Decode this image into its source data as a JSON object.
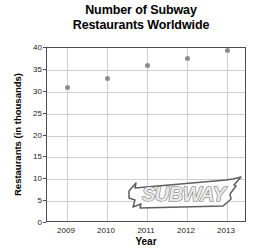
{
  "chart_data": {
    "type": "scatter",
    "title": "Number of Subway Restaurants Worldwide",
    "title_lines": [
      "Number of Subway",
      "Restaurants Worldwide"
    ],
    "xlabel": "Year",
    "ylabel": "Restaurants (in thousands)",
    "categories": [
      2009,
      2010,
      2011,
      2012,
      2013
    ],
    "x": [
      2009,
      2010,
      2011,
      2012,
      2013
    ],
    "values": [
      31,
      33,
      36,
      37.5,
      39.5
    ],
    "series": [
      {
        "name": "Subway restaurants worldwide",
        "values": [
          31,
          33,
          36,
          37.5,
          39.5
        ]
      }
    ],
    "points": [
      {
        "x": 2009,
        "y": 31
      },
      {
        "x": 2010,
        "y": 33
      },
      {
        "x": 2011,
        "y": 36
      },
      {
        "x": 2012,
        "y": 37.5
      },
      {
        "x": 2013,
        "y": 39.5
      }
    ],
    "xlim": [
      2008.5,
      2013.5
    ],
    "ylim": [
      0,
      40
    ],
    "yticks": [
      0,
      5,
      10,
      15,
      20,
      25,
      30,
      35,
      40
    ],
    "ytick_labels": [
      "0",
      "5",
      "10",
      "15",
      "20",
      "25",
      "30",
      "35",
      "40"
    ],
    "xticks": [
      2009,
      2010,
      2011,
      2012,
      2013
    ],
    "xtick_labels": [
      "2009",
      "2010",
      "2011",
      "2012",
      "2013"
    ],
    "grid": true,
    "legend": null,
    "marker_color": "#8c8c8c",
    "grid_color": "#cfcfcf",
    "axis_color": "#4d4d4d",
    "background_color": "#ffffff",
    "annotations": [
      {
        "name": "subway-logo-watermark",
        "text": "SUBWAY",
        "kind": "logo"
      }
    ]
  }
}
